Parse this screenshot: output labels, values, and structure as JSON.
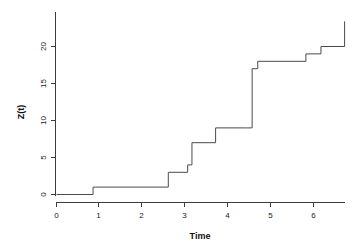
{
  "chart_data": {
    "type": "line",
    "subtype": "step-function",
    "title": "",
    "xlabel": "Time",
    "ylabel": "Z(t)",
    "xlim": [
      -0.15,
      6.75
    ],
    "ylim": [
      -1.2,
      23.5
    ],
    "xticks": [
      0,
      1,
      2,
      3,
      4,
      5,
      6
    ],
    "xtick_labels": [
      "0",
      "1",
      "2",
      "3",
      "4",
      "5",
      "6"
    ],
    "yticks": [
      0,
      5,
      10,
      15,
      20
    ],
    "ytick_labels": [
      "0",
      "5",
      "10",
      "15",
      "20"
    ],
    "grid": false,
    "legend": null,
    "line_color": "#4a4a4a",
    "axis_color": "#3c3c3c",
    "background_color": "#ffffff",
    "step_style": "hv",
    "x": [
      0.0,
      0.85,
      2.6,
      3.05,
      3.15,
      3.7,
      4.42,
      4.55,
      4.68,
      5.8,
      6.15,
      6.7,
      6.7
    ],
    "y": [
      0,
      1,
      3,
      4,
      7,
      9,
      9,
      17,
      18,
      19,
      20,
      20,
      23.4
    ],
    "points": [
      {
        "t": 0.0,
        "z": 0
      },
      {
        "t": 0.85,
        "z": 1
      },
      {
        "t": 2.6,
        "z": 3
      },
      {
        "t": 3.05,
        "z": 4
      },
      {
        "t": 3.15,
        "z": 7
      },
      {
        "t": 3.7,
        "z": 9
      },
      {
        "t": 4.42,
        "z": 9
      },
      {
        "t": 4.55,
        "z": 17
      },
      {
        "t": 4.68,
        "z": 18
      },
      {
        "t": 5.8,
        "z": 19
      },
      {
        "t": 6.15,
        "z": 20
      },
      {
        "t": 6.7,
        "z": 20
      },
      {
        "t": 6.7,
        "z": 23.4
      }
    ]
  },
  "axes": {
    "x_title": "Time",
    "y_title": "Z(t)"
  }
}
